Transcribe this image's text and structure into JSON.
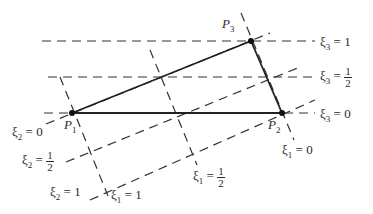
{
  "figure": {
    "type": "triangle-natural-coordinates",
    "points": {
      "P1": {
        "label": "P",
        "sub": "1",
        "x": 72,
        "y": 113
      },
      "P2": {
        "label": "P",
        "sub": "2",
        "x": 282,
        "y": 113
      },
      "P3": {
        "label": "P",
        "sub": "3",
        "x": 251,
        "y": 41
      }
    },
    "line_color": "#333333",
    "labels": {
      "xi3_1": {
        "var": "ξ",
        "sub": "3",
        "eq": " = ",
        "val": "1"
      },
      "xi3_half": {
        "var": "ξ",
        "sub": "3",
        "eq": " = ",
        "num": "1",
        "den": "2"
      },
      "xi3_0": {
        "var": "ξ",
        "sub": "3",
        "eq": " = ",
        "val": "0"
      },
      "xi2_0": {
        "var": "ξ",
        "sub": "2",
        "eq": " = ",
        "val": "0"
      },
      "xi2_half": {
        "var": "ξ",
        "sub": "2",
        "eq": " = ",
        "num": "1",
        "den": "2"
      },
      "xi2_1": {
        "var": "ξ",
        "sub": "2",
        "eq": " = ",
        "val": "1"
      },
      "xi1_1": {
        "var": "ξ",
        "sub": "1",
        "eq": " = ",
        "val": "1"
      },
      "xi1_half": {
        "var": "ξ",
        "sub": "1",
        "eq": " = ",
        "num": "1",
        "den": "2"
      },
      "xi1_0": {
        "var": "ξ",
        "sub": "1",
        "eq": " = ",
        "val": "0"
      }
    }
  }
}
